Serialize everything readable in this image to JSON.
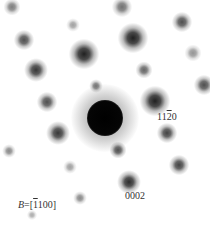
{
  "figure": {
    "type": "electron-diffraction-pattern",
    "labels": {
      "spot_1120": {
        "pre": "11",
        "bar": "2",
        "post": "0"
      },
      "spot_0002": "0002",
      "zone_axis": {
        "var": "B",
        "eq": "=[",
        "bar": "1",
        "post": "100]"
      }
    },
    "spots": [
      {
        "x": 12,
        "y": 7,
        "r": 5,
        "o": 0.55
      },
      {
        "x": 122,
        "y": 7,
        "r": 6,
        "o": 0.6
      },
      {
        "x": 73,
        "y": 25,
        "r": 4,
        "o": 0.4
      },
      {
        "x": 182,
        "y": 22,
        "r": 6,
        "o": 0.75
      },
      {
        "x": 24,
        "y": 40,
        "r": 6,
        "o": 0.75
      },
      {
        "x": 133,
        "y": 38,
        "r": 9,
        "o": 0.95
      },
      {
        "x": 84,
        "y": 54,
        "r": 9,
        "o": 0.95
      },
      {
        "x": 193,
        "y": 53,
        "r": 5,
        "o": 0.45
      },
      {
        "x": 36,
        "y": 70,
        "r": 7,
        "o": 0.85
      },
      {
        "x": 144,
        "y": 70,
        "r": 5,
        "o": 0.65
      },
      {
        "x": 96,
        "y": 86,
        "r": 4,
        "o": 0.6
      },
      {
        "x": 204,
        "y": 85,
        "r": 6,
        "o": 0.75
      },
      {
        "x": 47,
        "y": 102,
        "r": 6,
        "o": 0.75
      },
      {
        "x": 155,
        "y": 101,
        "r": 9,
        "o": 0.95
      },
      {
        "x": 58,
        "y": 133,
        "r": 7,
        "o": 0.85
      },
      {
        "x": 167,
        "y": 133,
        "r": 6,
        "o": 0.8
      },
      {
        "x": 9,
        "y": 151,
        "r": 4,
        "o": 0.5
      },
      {
        "x": 118,
        "y": 150,
        "r": 5,
        "o": 0.75
      },
      {
        "x": 70,
        "y": 167,
        "r": 4,
        "o": 0.4
      },
      {
        "x": 179,
        "y": 165,
        "r": 6,
        "o": 0.8
      },
      {
        "x": 129,
        "y": 182,
        "r": 7,
        "o": 0.9
      },
      {
        "x": 80,
        "y": 198,
        "r": 4,
        "o": 0.5
      },
      {
        "x": 32,
        "y": 215,
        "r": 3,
        "o": 0.35
      }
    ],
    "central_beam": {
      "x": 105,
      "y": 118,
      "r": 15,
      "halo": 34
    }
  }
}
